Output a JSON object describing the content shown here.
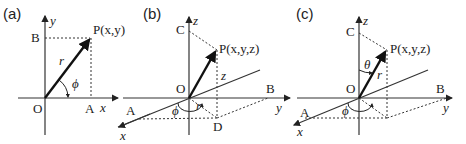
{
  "panels": [
    {
      "id": "a",
      "label": "(a)",
      "point": "P(x,y)",
      "axes": {
        "x": "x",
        "y": "y"
      },
      "points": {
        "origin": "O",
        "A": "A",
        "B": "B"
      },
      "radius": "r",
      "angle": "ϕ"
    },
    {
      "id": "b",
      "label": "(b)",
      "point": "P(x,y,z)",
      "axes": {
        "x": "x",
        "y": "y",
        "z": "z"
      },
      "points": {
        "origin": "O",
        "A": "A",
        "B": "B",
        "C": "C",
        "D": "D"
      },
      "radius": "r",
      "height": "z",
      "angle": "ϕ"
    },
    {
      "id": "c",
      "label": "(c)",
      "point": "P(x,y,z)",
      "axes": {
        "x": "x",
        "y": "y",
        "z": "z"
      },
      "points": {
        "origin": "O",
        "A": "A",
        "B": "B",
        "C": "C"
      },
      "radius": "r",
      "polar_angle": "θ",
      "angle": "ϕ"
    }
  ]
}
